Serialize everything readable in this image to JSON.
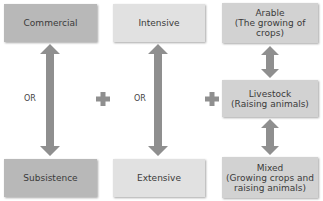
{
  "diagram": {
    "column1": {
      "top": "Commercial",
      "connector": "OR",
      "bottom": "Subsistence"
    },
    "operator1": "plus",
    "column2": {
      "top": "Intensive",
      "connector": "OR",
      "bottom": "Extensive"
    },
    "operator2": "plus",
    "column3": {
      "items": [
        {
          "title": "Arable",
          "subtitle": "(The growing of crops)"
        },
        {
          "title": "Livestock",
          "subtitle": "(Raising animals)"
        },
        {
          "title": "Mixed",
          "subtitle": "(Growing crops and raising animals)"
        }
      ]
    },
    "colors": {
      "dark_box": "#b8b8b8",
      "light_box": "#e1e1e1",
      "mid_box": "#d2d2d2",
      "arrow": "#8f8f8f"
    }
  }
}
